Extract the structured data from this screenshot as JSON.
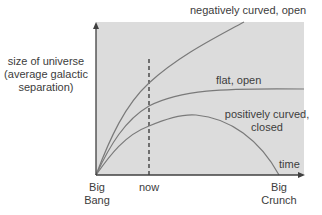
{
  "diagram": {
    "type": "universe-expansion-curves",
    "y_axis_label": [
      "size of universe",
      "(average galactic",
      "separation)"
    ],
    "x_axis_label": "time",
    "x_ticks": {
      "big_bang": [
        "Big",
        "Bang"
      ],
      "now": "now",
      "big_crunch": [
        "Big",
        "Crunch"
      ]
    },
    "curves": [
      {
        "id": "negative",
        "label": "negatively curved, open"
      },
      {
        "id": "flat",
        "label": "flat, open"
      },
      {
        "id": "positive",
        "label_lines": [
          "positively curved,",
          "closed"
        ]
      }
    ],
    "colors": {
      "plot_background": "#dcdcdc",
      "curve": "#7a7a7a",
      "axis": "#404040",
      "dashed_line": "#404040"
    }
  }
}
